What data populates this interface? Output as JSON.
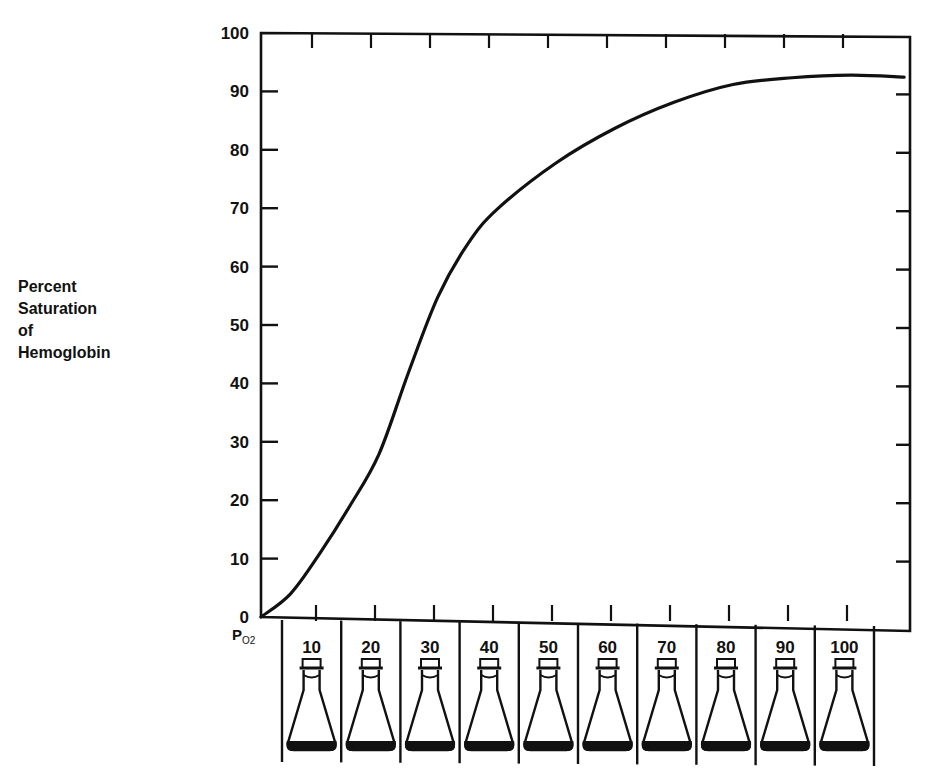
{
  "chart_data": {
    "type": "line",
    "title": "",
    "xlabel": "PO2",
    "ylabel": "Percent Saturation of Hemoglobin",
    "ylim": [
      0,
      100
    ],
    "xlim": [
      0,
      110
    ],
    "y_ticks": [
      0,
      10,
      20,
      30,
      40,
      50,
      60,
      70,
      80,
      90,
      100
    ],
    "x_ticks": [
      10,
      20,
      30,
      40,
      50,
      60,
      70,
      80,
      90,
      100
    ],
    "grid": false,
    "legend": null,
    "series": [
      {
        "name": "Oxyhemoglobin dissociation curve",
        "x": [
          0,
          5,
          10,
          15,
          20,
          25,
          30,
          35,
          40,
          50,
          60,
          70,
          80,
          90,
          100,
          109
        ],
        "values": [
          0,
          4,
          11,
          19,
          28,
          42,
          55,
          64,
          70,
          78,
          84,
          88.5,
          91.6,
          92.8,
          93.3,
          93
        ]
      }
    ],
    "annotations": [
      "Erlenmeyer flask illustration under each PO2 value (10-100)"
    ]
  },
  "axis": {
    "y_label_lines": [
      "Percent",
      "Saturation",
      "of",
      "Hemoglobin"
    ],
    "x_label_main": "P",
    "x_label_sub": "O2"
  }
}
